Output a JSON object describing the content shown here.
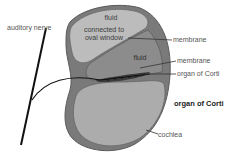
{
  "diagram": {
    "labels": {
      "auditory_nerve": "auditory nerve",
      "fluid_top_line1": "fluid",
      "fluid_top_line2": "connected to",
      "fluid_top_line3": "oval window",
      "membrane_upper": "membrane",
      "fluid_middle": "fluid",
      "membrane_lower": "membrane",
      "organ_of_corti_pointer": "organ of Corti",
      "organ_of_corti_title": "organ of Corti",
      "cochlea": "cochlea"
    },
    "colors": {
      "outer_shell": "#6e6e6e",
      "upper_chamber": "#b8b8b8",
      "middle_chamber": "#8a8a8a",
      "lower_chamber": "#a9a9a9",
      "nerve": "#111111",
      "leader_lines": "#333333"
    }
  }
}
